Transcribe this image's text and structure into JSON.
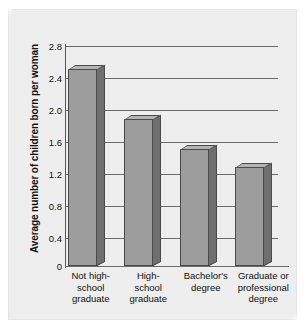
{
  "chart_data": {
    "type": "bar",
    "title": "",
    "subtitle": "",
    "xlabel": "",
    "ylabel": "Average number of children born per woman",
    "ylim": [
      0,
      3.0
    ],
    "yticks": [
      "2.8",
      "2.4",
      "2.0",
      "1.6",
      "1.2",
      "0.8",
      "0.4",
      "0"
    ],
    "ytick_values": [
      2.8,
      2.4,
      2.0,
      1.6,
      1.2,
      0.8,
      0.4,
      0
    ],
    "grid": true,
    "legend": "none",
    "categories": [
      "Not high-school graduate",
      "High-school graduate",
      "Bachelor's degree",
      "Graduate or professional degree"
    ],
    "category_lines": [
      [
        "Not high-",
        "school",
        "graduate"
      ],
      [
        "High-",
        "school",
        "graduate"
      ],
      [
        "Bachelor's",
        "degree"
      ],
      [
        "Graduate or",
        "professional",
        "degree"
      ]
    ],
    "values": [
      2.68,
      2.0,
      1.59,
      1.35
    ],
    "series": [
      {
        "name": "Average number of children born per woman",
        "values": [
          2.68,
          2.0,
          1.59,
          1.35
        ]
      }
    ],
    "colors": {
      "bar_front": "#9d9d9d",
      "bar_side": "#6f6f6f",
      "bar_top": "#b4b4b4",
      "bar_outline": "#4a4a4a",
      "gridline": "#6b6b6b",
      "axis": "#555555",
      "panel_background": "#eeeeee",
      "text": "#111111"
    }
  }
}
